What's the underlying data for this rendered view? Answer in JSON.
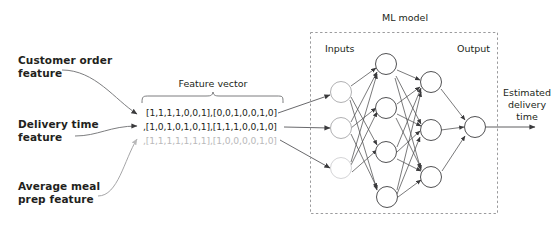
{
  "diagram": {
    "features": [
      {
        "line1": "Customer order",
        "line2": "feature"
      },
      {
        "line1": "Delivery time",
        "line2": "feature"
      },
      {
        "line1": "Average meal",
        "line2": "prep feature"
      }
    ],
    "feature_vector": {
      "label": "Feature vector",
      "rows": [
        {
          "text": "[1,1,1,1,0,0,1],[0,0,1,0,0,1,0]",
          "faded": false
        },
        {
          "text": ",[1,0,1,0,1,0,1],[1,1,1,0,0,1,0]",
          "faded": false
        },
        {
          "text": ",[1,1,1,1,1,1,1],[1,0,0,0,0,1,0]",
          "faded": true
        }
      ]
    },
    "model": {
      "title": "ML model",
      "input_label": "Inputs",
      "output_label": "Output",
      "layers": [
        {
          "name": "input-layer",
          "nodes": 3
        },
        {
          "name": "hidden-layer-1",
          "nodes": 4
        },
        {
          "name": "hidden-layer-2",
          "nodes": 3
        },
        {
          "name": "output-layer",
          "nodes": 1
        }
      ]
    },
    "result": {
      "line1": "Estimated",
      "line2": "delivery",
      "line3": "time"
    },
    "colors": {
      "ink": "#231f20",
      "stroke": "#4d4d4f",
      "faded": "#b9b9ba",
      "dash": "#9b9b9d",
      "background": "#ffffff"
    }
  }
}
